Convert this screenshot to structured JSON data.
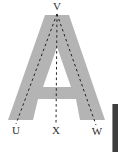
{
  "figure": {
    "letter": {
      "char": "A",
      "fill_color": "#b4b4b4"
    },
    "labels": {
      "top": "V",
      "bottom_left": "U",
      "bottom_center": "X",
      "bottom_right": "W"
    },
    "lines": {
      "style": "dashed",
      "color": "#222222",
      "segments": [
        {
          "name": "V-U",
          "from": "V",
          "to": "U"
        },
        {
          "name": "V-X",
          "from": "V",
          "to": "X"
        },
        {
          "name": "V-W",
          "from": "V",
          "to": "W"
        }
      ]
    },
    "label_color": "#2e2e2e",
    "background_color": "#ffffff",
    "right_edge_fragment_color": "#3e3e3e"
  }
}
